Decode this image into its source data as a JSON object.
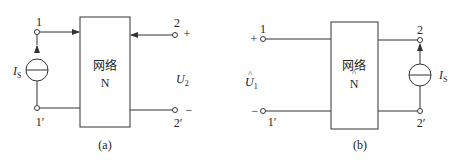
{
  "figure_a": {
    "block_label_cn": "网络",
    "block_label": "N",
    "port1_top": "1",
    "port1_bottom": "1′",
    "port2_top": "2",
    "port2_bottom": "2′",
    "source_label": "I",
    "source_sub": "S",
    "voltage_label": "U",
    "voltage_sub": "2",
    "plus": "+",
    "minus": "−",
    "caption": "(a)"
  },
  "figure_b": {
    "block_label_cn": "网络",
    "block_label": "N",
    "block_hat": "^",
    "port1_top": "1",
    "port1_bottom": "1′",
    "port2_top": "2",
    "port2_bottom": "2′",
    "source_label": "I",
    "source_sub": "S",
    "voltage_label": "U",
    "voltage_sub": "1",
    "voltage_hat": "^",
    "plus": "+",
    "minus": "−",
    "caption": "(b)"
  },
  "colors": {
    "stroke": "#333333",
    "background": "#ffffff"
  }
}
